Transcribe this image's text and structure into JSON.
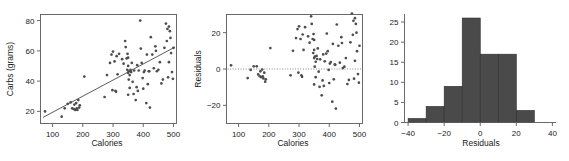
{
  "figure": {
    "background": "#ffffff",
    "point_color": "#4d4d4d",
    "bar_color": "#4a4a4a",
    "axis_color": "#5a5a5a"
  },
  "chart_data": [
    {
      "type": "scatter",
      "name": "carbs-vs-calories",
      "title": "",
      "xlabel": "Calories",
      "ylabel": "Carbs (grams)",
      "xlim": [
        60,
        510
      ],
      "ylim": [
        12,
        84
      ],
      "xticks": [
        100,
        200,
        300,
        400,
        500
      ],
      "yticks": [
        20,
        40,
        60,
        80
      ],
      "grid": false,
      "legend": "none",
      "trendline": {
        "label": "least-squares line",
        "x": [
          68,
          505
        ],
        "y": [
          16.0,
          62.5
        ]
      },
      "x": [
        75,
        130,
        140,
        150,
        160,
        165,
        170,
        172,
        175,
        178,
        180,
        182,
        185,
        188,
        190,
        205,
        272,
        280,
        290,
        295,
        298,
        300,
        305,
        308,
        310,
        312,
        315,
        320,
        330,
        335,
        340,
        342,
        345,
        347,
        348,
        350,
        350,
        350,
        350,
        352,
        352,
        355,
        355,
        358,
        360,
        362,
        365,
        368,
        370,
        375,
        378,
        380,
        382,
        385,
        390,
        392,
        395,
        398,
        400,
        402,
        405,
        410,
        412,
        415,
        418,
        420,
        422,
        425,
        430,
        435,
        440,
        442,
        445,
        450,
        455,
        460,
        465,
        470,
        475,
        478,
        480,
        482,
        485,
        485,
        488,
        490,
        492,
        495,
        498,
        500
      ],
      "y": [
        20.0,
        16.5,
        22.0,
        25.0,
        26.0,
        22.0,
        21.5,
        24.5,
        21.0,
        25.5,
        22.0,
        21.0,
        27.5,
        22.5,
        24.0,
        43.0,
        29.5,
        44.0,
        52.0,
        57.5,
        34.0,
        59.5,
        53.0,
        33.5,
        33.0,
        56.5,
        44.5,
        58.0,
        54.5,
        51.5,
        66.5,
        62.5,
        55.0,
        47.5,
        58.0,
        31.0,
        45.5,
        50.0,
        55.5,
        46.5,
        41.0,
        35.5,
        44.0,
        47.5,
        46.0,
        52.0,
        39.5,
        31.5,
        47.0,
        27.5,
        36.0,
        50.5,
        33.5,
        47.0,
        80.0,
        61.5,
        52.0,
        42.0,
        35.0,
        46.0,
        47.0,
        25.5,
        57.5,
        38.0,
        46.5,
        46.5,
        22.5,
        69.0,
        57.5,
        48.5,
        63.0,
        60.0,
        46.5,
        47.5,
        52.5,
        38.5,
        41.0,
        62.0,
        78.0,
        66.5,
        74.5,
        42.5,
        76.0,
        52.5,
        73.0,
        68.5,
        58.5,
        46.0,
        41.5,
        62.0
      ]
    },
    {
      "type": "scatter",
      "name": "residuals-vs-calories",
      "title": "",
      "xlabel": "Calories",
      "ylabel": "Residuals",
      "xlim": [
        60,
        510
      ],
      "ylim": [
        -30,
        30
      ],
      "xticks": [
        100,
        200,
        300,
        400,
        500
      ],
      "yticks": [
        -20,
        0,
        20
      ],
      "grid": false,
      "legend": "none",
      "reference_line": {
        "label": "zero-line",
        "y": 0,
        "style": "dotted"
      },
      "x": [
        75,
        130,
        140,
        150,
        160,
        165,
        170,
        172,
        175,
        178,
        180,
        182,
        185,
        188,
        190,
        205,
        272,
        280,
        290,
        295,
        298,
        300,
        305,
        308,
        310,
        312,
        315,
        320,
        330,
        335,
        340,
        342,
        345,
        347,
        348,
        350,
        350,
        350,
        350,
        352,
        352,
        355,
        355,
        358,
        360,
        362,
        365,
        368,
        370,
        375,
        378,
        380,
        382,
        385,
        390,
        392,
        395,
        398,
        400,
        402,
        405,
        410,
        412,
        415,
        418,
        420,
        422,
        425,
        430,
        435,
        440,
        442,
        445,
        450,
        455,
        460,
        465,
        470,
        475,
        478,
        480,
        482,
        485,
        485,
        488,
        490,
        492,
        495,
        498,
        500
      ],
      "y": [
        2.0,
        -5.0,
        -0.5,
        1.5,
        1.5,
        -3.0,
        -4.0,
        -1.3,
        -4.5,
        -0.3,
        -4.0,
        -5.2,
        -2.0,
        -7.0,
        -5.7,
        11.5,
        -3.5,
        10.0,
        17.0,
        22.0,
        -2.0,
        23.5,
        16.5,
        -3.5,
        -4.3,
        19.0,
        10.5,
        23.0,
        18.0,
        14.5,
        29.0,
        24.8,
        16.5,
        8.8,
        19.2,
        -8.5,
        6.0,
        10.5,
        16.0,
        6.8,
        1.3,
        -4.5,
        4.0,
        7.2,
        5.5,
        11.3,
        -1.5,
        -9.8,
        5.3,
        -14.5,
        -6.3,
        8.0,
        -9.3,
        4.2,
        8.5,
        19.5,
        9.8,
        -0.5,
        -7.7,
        3.0,
        3.8,
        -18.0,
        13.8,
        -5.7,
        2.5,
        2.3,
        -21.8,
        24.5,
        12.8,
        3.5,
        17.5,
        14.3,
        0.5,
        1.3,
        6.0,
        -8.3,
        -6.0,
        14.7,
        30.5,
        18.8,
        26.5,
        -5.3,
        28.0,
        4.5,
        24.8,
        20.0,
        9.8,
        -2.8,
        -7.5,
        12.8
      ]
    },
    {
      "type": "bar",
      "subtype": "histogram",
      "name": "residuals-histogram",
      "title": "",
      "xlabel": "Residuals",
      "ylabel": "",
      "xlim": [
        -42,
        42
      ],
      "ylim": [
        0,
        27
      ],
      "xticks": [
        -40,
        -20,
        0,
        20,
        40
      ],
      "yticks": [
        0,
        5,
        10,
        15,
        20,
        25
      ],
      "grid": false,
      "legend": "none",
      "bin_width": 10,
      "bin_edges": [
        -40,
        -30,
        -20,
        -10,
        0,
        10,
        20,
        30
      ],
      "categories": [
        "-40 to -30",
        "-30 to -20",
        "-20 to -10",
        "-10 to 0",
        "0 to 10",
        "10 to 20",
        "20 to 30"
      ],
      "values": [
        1,
        4,
        9,
        26,
        17,
        17,
        3
      ]
    }
  ]
}
